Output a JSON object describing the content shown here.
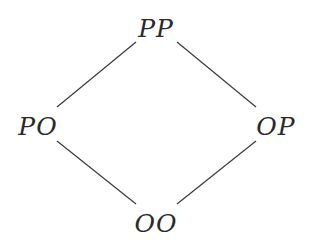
{
  "diagram": {
    "type": "lattice",
    "nodes": [
      {
        "id": "PP",
        "label": "PP",
        "x": 156,
        "y": 28
      },
      {
        "id": "PO",
        "label": "PO",
        "x": 38,
        "y": 126
      },
      {
        "id": "OP",
        "label": "OP",
        "x": 276,
        "y": 126
      },
      {
        "id": "OO",
        "label": "OO",
        "x": 156,
        "y": 223
      }
    ],
    "edges": [
      {
        "from": "PP",
        "to": "PO"
      },
      {
        "from": "PP",
        "to": "OP"
      },
      {
        "from": "PO",
        "to": "OO"
      },
      {
        "from": "OP",
        "to": "OO"
      }
    ],
    "line_color": "#3a3a3a",
    "text_color": "#2a2a2a"
  }
}
